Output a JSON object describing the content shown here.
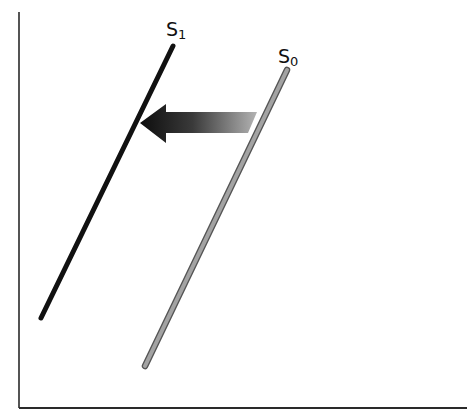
{
  "diagram": {
    "type": "supply-shift",
    "axes": {
      "x_axis": {
        "from": [
          19,
          408
        ],
        "to": [
          467,
          408
        ],
        "color": "#222222"
      },
      "y_axis": {
        "from": [
          19,
          12
        ],
        "to": [
          19,
          408
        ],
        "color": "#222222"
      }
    },
    "curves": [
      {
        "id": "s1",
        "label": "S",
        "subscript": "1",
        "from": [
          41,
          318
        ],
        "to": [
          173,
          46
        ],
        "color": "#111111",
        "style": "solid-black"
      },
      {
        "id": "s0",
        "label": "S",
        "subscript": "0",
        "from": [
          145,
          366
        ],
        "to": [
          287,
          70
        ],
        "color": "#9a9a9a",
        "style": "gray-outlined"
      }
    ],
    "arrow": {
      "direction": "left",
      "meaning": "supply shifts left from S0 to S1",
      "gradient_start": "#111111",
      "gradient_end": "#b0b0b0"
    }
  },
  "labels": {
    "s1_main": "S",
    "s1_sub": "1",
    "s0_main": "S",
    "s0_sub": "0"
  }
}
